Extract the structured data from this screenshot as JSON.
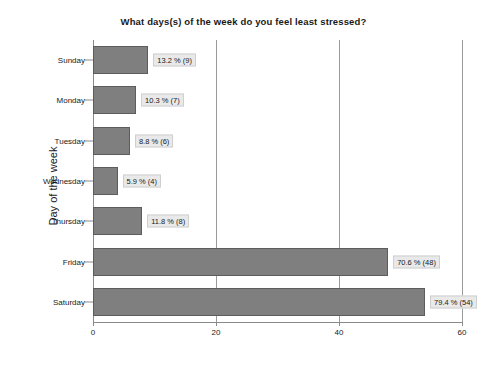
{
  "chart_data": {
    "type": "bar",
    "orientation": "horizontal",
    "title": "What days(s) of the week do you feel least stressed?",
    "xlabel": "",
    "ylabel": "Day of the week",
    "categories": [
      "Sunday",
      "Monday",
      "Tuesday",
      "Wednesday",
      "Thursday",
      "Friday",
      "Saturday"
    ],
    "values": [
      9,
      7,
      6,
      4,
      8,
      48,
      54
    ],
    "percents": [
      13.2,
      10.3,
      8.8,
      5.9,
      11.8,
      70.6,
      79.4
    ],
    "data_labels": [
      "13.2 % (9)",
      "10.3 % (7)",
      "8.8 % (6)",
      "5.9 % (4)",
      "11.8 % (8)",
      "70.6 % (48)",
      "79.4 % (54)"
    ],
    "xlim": [
      0,
      60
    ],
    "xticks": [
      0,
      20,
      40,
      60
    ],
    "xtick_labels": [
      "0",
      "20",
      "40",
      "60"
    ],
    "grid": "vertical",
    "legend": "none",
    "bar_color": "#7f7f7f",
    "bar_border_color": "#5c5c5c",
    "label_box_color": "#e9e9e9",
    "axis_color": "#8a8a8a",
    "background": "#ffffff"
  }
}
